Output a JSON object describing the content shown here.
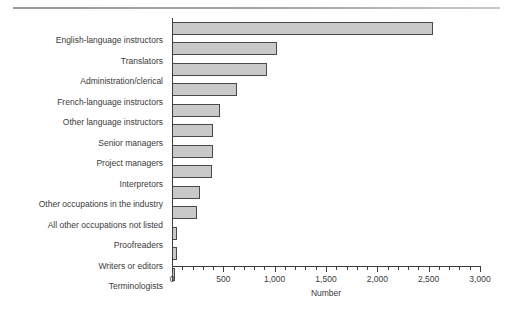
{
  "top": {
    "clipped_caption": "",
    "rule": "horizontal-rule"
  },
  "chart_data": {
    "type": "bar",
    "orientation": "horizontal",
    "title": "",
    "subtitle": "",
    "xlabel": "Number",
    "ylabel": "",
    "xlim": [
      0,
      3000
    ],
    "xticks": [
      "0",
      "500",
      "1,000",
      "1,500",
      "2,000",
      "2,500",
      "3,000"
    ],
    "xtick_values": [
      0,
      500,
      1000,
      1500,
      2000,
      2500,
      3000
    ],
    "grid": false,
    "legend": false,
    "bar_fill": "#c9c9c9",
    "bar_border": "#4a4a4a",
    "categories": [
      "English-language instructors",
      "Translators",
      "Administration/clerical",
      "French-language instructors",
      "Other language instructors",
      "Senior managers",
      "Project managers",
      "Interpretors",
      "Other occupations in the industry",
      "All other occupations not listed",
      "Proofreaders",
      "Writers or editors",
      "Terminologists"
    ],
    "values": [
      2540,
      1020,
      925,
      635,
      470,
      400,
      395,
      390,
      275,
      240,
      50,
      45,
      30
    ]
  }
}
